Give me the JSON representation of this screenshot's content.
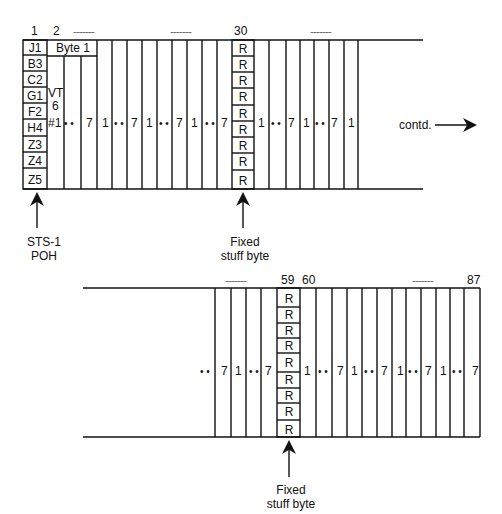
{
  "top_frame": {
    "col_labels": {
      "c1": "1",
      "c2": "2",
      "c30": "30"
    },
    "dots_label": "..............",
    "poh_bytes": [
      "J1",
      "B3",
      "C2",
      "G1",
      "F2",
      "H4",
      "Z3",
      "Z4",
      "Z5"
    ],
    "byte1_label": "Byte 1",
    "vt_label": {
      "line1": "VT",
      "line2": "6",
      "line3": "#1"
    },
    "stuff_bytes": [
      "R",
      "R",
      "R",
      "R",
      "R",
      "R",
      "R",
      "R",
      "R"
    ],
    "seq_labels": [
      "1",
      "7"
    ],
    "ellipsis": "• •",
    "contd_label": "contd.",
    "poh_caption": {
      "line1": "STS-1",
      "line2": "POH"
    },
    "stuff_caption": {
      "line1": "Fixed",
      "line2": "stuff byte"
    }
  },
  "bottom_frame": {
    "col_labels": {
      "c59": "59",
      "c60": "60",
      "c87": "87"
    },
    "dots_label": "..............",
    "stuff_bytes": [
      "R",
      "R",
      "R",
      "R",
      "R",
      "R",
      "R",
      "R",
      "R"
    ],
    "stuff_caption": {
      "line1": "Fixed",
      "line2": "stuff byte"
    }
  }
}
